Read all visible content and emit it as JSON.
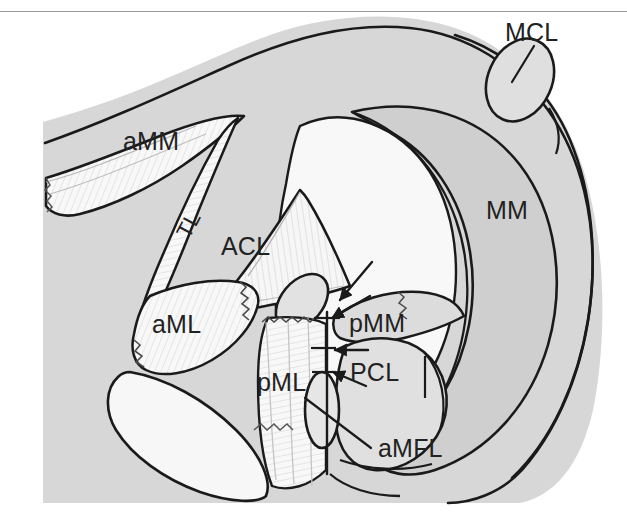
{
  "figure": {
    "kind": "anatomical-diagram",
    "top_rule_color": "#9a9a9a",
    "background_color": "#ffffff",
    "plate_fill_color": "#d7d7d7",
    "plate_fill_color_mid": "#cfcfcf",
    "plate_fill_color_light": "#efefef",
    "structure_fill_color": "#f7f7f7",
    "ink_color": "#1a1a1a"
  },
  "labels": {
    "mcl": "MCL",
    "amm": "aMM",
    "tl": "TL",
    "acl": "ACL",
    "mm": "MM",
    "aml": "aML",
    "pmm": "pMM",
    "pml": "pML",
    "pcl": "PCL",
    "amfl": "aMFL"
  },
  "annotations": {
    "arrow_count": 4,
    "arrow_meaning": "arrows indicating the posterior medial meniscus root tear line",
    "tear_line_orientation": "vertical"
  }
}
